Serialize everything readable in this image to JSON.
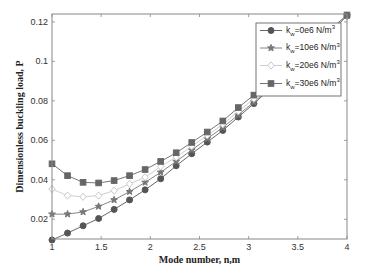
{
  "chart_data": {
    "type": "line",
    "title": "",
    "xlabel": "Mode number, n,m",
    "ylabel": "Dimensionless buckling load, P",
    "xlim": [
      1,
      4
    ],
    "ylim": [
      0.01,
      0.124
    ],
    "xticks": [
      1,
      1.5,
      2,
      2.5,
      3,
      3.5,
      4
    ],
    "xtick_labels": [
      "1",
      "1.5",
      "2",
      "2.5",
      "3",
      "3.5",
      "4"
    ],
    "yticks": [
      0.02,
      0.04,
      0.06,
      0.08,
      0.1,
      0.12
    ],
    "ytick_labels": [
      "0.02",
      "0.04",
      "0.06",
      "0.08",
      "0.1",
      "0.12"
    ],
    "grid": false,
    "legend_position": "upper right",
    "x": [
      1.0,
      1.158,
      1.316,
      1.474,
      1.632,
      1.789,
      1.947,
      2.105,
      2.263,
      2.421,
      2.579,
      2.737,
      2.895,
      3.053,
      3.211,
      3.368,
      3.526,
      3.684,
      3.842,
      4.0
    ],
    "series": [
      {
        "name": "k_w=0e6 N/m^3",
        "label_main": "k",
        "label_sub": "w",
        "label_rest": "=0e6 N/m",
        "label_sup": "3",
        "marker": "circle",
        "color": "#555555",
        "fill": "#555555",
        "values": [
          0.0095,
          0.013,
          0.0167,
          0.0204,
          0.025,
          0.0298,
          0.0349,
          0.0405,
          0.0471,
          0.0532,
          0.0591,
          0.065,
          0.0718,
          0.0786,
          0.0857,
          0.093,
          0.1003,
          0.1077,
          0.1153,
          0.123
        ]
      },
      {
        "name": "k_w=10e6 N/m^3",
        "label_main": "k",
        "label_sub": "w",
        "label_rest": "=10e6 N/m",
        "label_sup": "3",
        "marker": "star",
        "color": "#777777",
        "fill": "#777777",
        "values": [
          0.0226,
          0.0226,
          0.0237,
          0.0265,
          0.0298,
          0.034,
          0.0387,
          0.0438,
          0.0493,
          0.0551,
          0.0608,
          0.0665,
          0.0729,
          0.0794,
          0.0863,
          0.0934,
          0.1006,
          0.1079,
          0.1154,
          0.1231
        ]
      },
      {
        "name": "k_w=20e6 N/m^3",
        "label_main": "k",
        "label_sub": "w",
        "label_rest": "=20e6 N/m",
        "label_sup": "3",
        "marker": "diamond",
        "color": "#c8c8c8",
        "fill": "#ffffff",
        "values": [
          0.0353,
          0.032,
          0.0314,
          0.032,
          0.0345,
          0.0379,
          0.0413,
          0.0467,
          0.0515,
          0.057,
          0.0625,
          0.0681,
          0.0747,
          0.0811,
          0.0877,
          0.0945,
          0.1014,
          0.1085,
          0.1158,
          0.1233
        ]
      },
      {
        "name": "k_w=30e6 N/m^3",
        "label_main": "k",
        "label_sub": "w",
        "label_rest": "=30e6 N/m",
        "label_sup": "3",
        "marker": "square",
        "color": "#666666",
        "fill": "#666666",
        "values": [
          0.0481,
          0.0421,
          0.0387,
          0.0384,
          0.0396,
          0.0421,
          0.0452,
          0.0493,
          0.0537,
          0.0589,
          0.0642,
          0.0698,
          0.0766,
          0.0829,
          0.0895,
          0.0963,
          0.1031,
          0.1099,
          0.1167,
          0.1235
        ]
      }
    ]
  },
  "layout": {
    "plot": {
      "left": 52,
      "right": 347,
      "top": 14,
      "bottom": 239
    },
    "legend": {
      "x": 256,
      "y": 23,
      "w": 85,
      "h": 73
    }
  }
}
